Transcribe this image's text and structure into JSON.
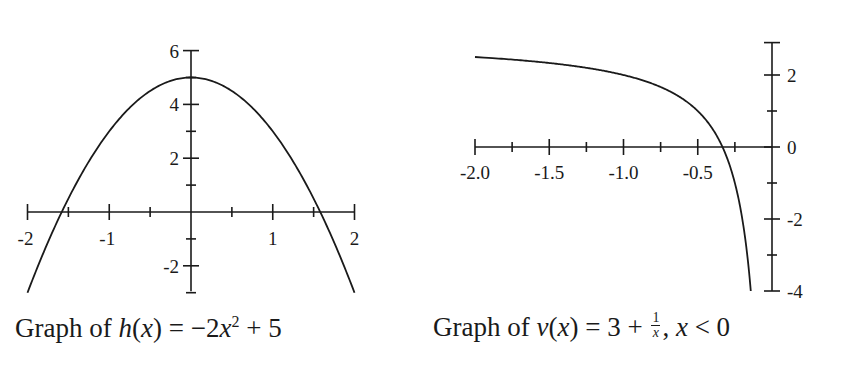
{
  "chart_data": [
    {
      "type": "line",
      "title": "Graph of h(x) = −2x² + 5",
      "function": "h(x) = -2x^2 + 5",
      "xlabel": "",
      "ylabel": "",
      "xlim": [
        -2,
        2
      ],
      "ylim": [
        -3,
        6
      ],
      "x_ticks": [
        -2,
        -1.5,
        -1,
        -0.5,
        0,
        0.5,
        1,
        1.5,
        2
      ],
      "x_tick_labels": [
        "-2",
        "-1",
        "1",
        "2"
      ],
      "y_ticks": [
        -3,
        -2,
        -1,
        1,
        2,
        3,
        4,
        5,
        6
      ],
      "y_tick_labels": [
        "6",
        "4",
        "2",
        "-2"
      ],
      "grid": false,
      "legend": "none",
      "series": [
        {
          "name": "h(x)",
          "x": [
            -2,
            -1.5,
            -1,
            -0.5,
            0,
            0.5,
            1,
            1.5,
            2
          ],
          "y": [
            -3,
            0.5,
            3,
            4.5,
            5,
            4.5,
            3,
            0.5,
            -3
          ]
        }
      ],
      "key_points": {
        "vertex": [
          0,
          5
        ],
        "x_intercepts": [
          -1.58,
          1.58
        ]
      }
    },
    {
      "type": "line",
      "title": "Graph of v(x) = 3 + 1/x, x < 0",
      "function": "v(x) = 3 + 1/x, x < 0",
      "xlabel": "",
      "ylabel": "",
      "xlim": [
        -2,
        0
      ],
      "ylim": [
        -4,
        2.9
      ],
      "x_ticks": [
        -2.0,
        -1.75,
        -1.5,
        -1.25,
        -1.0,
        -0.75,
        -0.5,
        -0.25,
        0
      ],
      "x_tick_labels": [
        "-2.0",
        "-1.5",
        "-1.0",
        "-0.5"
      ],
      "y_ticks": [
        -4,
        -3,
        -2,
        -1,
        0,
        1,
        2,
        2.9
      ],
      "y_tick_labels": [
        "2",
        "0",
        "-2",
        "-4"
      ],
      "grid": false,
      "legend": "none",
      "series": [
        {
          "name": "v(x)",
          "x": [
            -2.0,
            -1.5,
            -1.0,
            -0.5,
            -0.333,
            -0.25,
            -0.2,
            -0.143
          ],
          "y": [
            2.5,
            2.333,
            2.0,
            1.0,
            0.0,
            -1.0,
            -2.0,
            -4.0
          ]
        }
      ],
      "key_points": {
        "x_intercept": [
          -0.333,
          0
        ]
      }
    }
  ],
  "captions": {
    "left": {
      "prefix": "Graph of ",
      "fn": "h",
      "var": "x",
      "eq": " = −2",
      "var2": "x",
      "exp": "2",
      "tail": " + 5"
    },
    "right": {
      "prefix": "Graph of ",
      "fn": "v",
      "var": "x",
      "eq": " = 3 + ",
      "num": "1",
      "den": "x",
      "tail": ", ",
      "var3": "x",
      "cond": " < 0"
    }
  },
  "style": {
    "line_color": "#1a1a1a",
    "background": "#ffffff"
  }
}
